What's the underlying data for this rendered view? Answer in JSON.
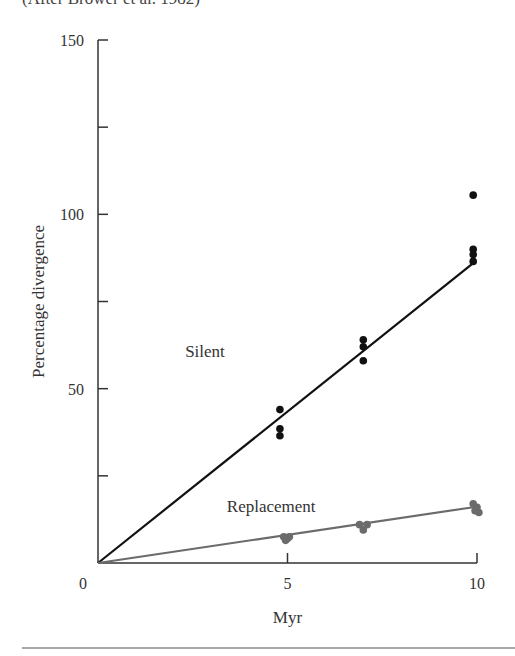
{
  "caption": "(After Brower et al. 1982)",
  "chart_data": {
    "type": "scatter",
    "title": "",
    "xlabel": "Myr",
    "ylabel": "Percentage divergence",
    "xlim": [
      0,
      10
    ],
    "ylim": [
      0,
      150
    ],
    "x_ticks": [
      0,
      5,
      10
    ],
    "x_tick_labels": [
      "0",
      "5",
      "10"
    ],
    "y_ticks": [
      0,
      25,
      50,
      75,
      100,
      125,
      150
    ],
    "y_tick_labels": [
      "0",
      "",
      "50",
      "",
      "100",
      "",
      "150"
    ],
    "grid": false,
    "series": [
      {
        "name": "Silent",
        "color": "#111111",
        "points": [
          {
            "x": 4.8,
            "y": 44
          },
          {
            "x": 4.8,
            "y": 38.5
          },
          {
            "x": 4.8,
            "y": 36.5
          },
          {
            "x": 7.0,
            "y": 64
          },
          {
            "x": 7.0,
            "y": 62
          },
          {
            "x": 7.0,
            "y": 58
          },
          {
            "x": 9.9,
            "y": 105.5
          },
          {
            "x": 9.9,
            "y": 90
          },
          {
            "x": 9.9,
            "y": 88.5
          },
          {
            "x": 9.9,
            "y": 86.5
          }
        ],
        "fit_line": {
          "x": [
            0,
            9.9
          ],
          "y": [
            0,
            86
          ]
        }
      },
      {
        "name": "Replacement",
        "color": "#6b6b6b",
        "points": [
          {
            "x": 4.9,
            "y": 7.5
          },
          {
            "x": 5.0,
            "y": 7.0
          },
          {
            "x": 5.05,
            "y": 7.5
          },
          {
            "x": 4.95,
            "y": 6.5
          },
          {
            "x": 6.9,
            "y": 11
          },
          {
            "x": 7.1,
            "y": 11
          },
          {
            "x": 7.0,
            "y": 9.5
          },
          {
            "x": 9.9,
            "y": 17
          },
          {
            "x": 10.0,
            "y": 16
          },
          {
            "x": 9.95,
            "y": 15
          },
          {
            "x": 10.05,
            "y": 14.5
          }
        ],
        "fit_line": {
          "x": [
            0,
            9.9
          ],
          "y": [
            0,
            16
          ]
        }
      }
    ],
    "annotations": [
      {
        "text": "Silent",
        "x": 2.3,
        "y": 59
      },
      {
        "text": "Replacement",
        "x": 3.4,
        "y": 14.5
      }
    ]
  }
}
